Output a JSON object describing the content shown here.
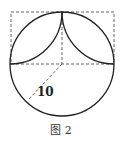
{
  "figure": {
    "caption": "图 2",
    "radius_label": "10"
  },
  "geometry": {
    "circle": {
      "cx": 62,
      "cy": 64,
      "r": 52
    },
    "dashed_rect": {
      "x": 11,
      "y": 12,
      "w": 103,
      "h": 52
    },
    "radius_line": {
      "x1": 62,
      "y1": 64,
      "x2": 28,
      "y2": 100
    },
    "stroke_color": "#222222",
    "dash_color": "#555555"
  }
}
